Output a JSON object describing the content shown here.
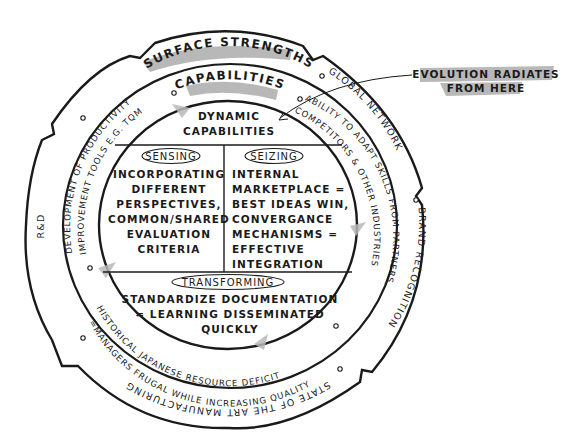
{
  "diagram": {
    "colors": {
      "ink": "#1a1a1a",
      "highlight": "#b8b8b8",
      "background": "#ffffff"
    },
    "outer_ring": {
      "heading": "SURFACE STRENGTHS",
      "items": [
        "GLOBAL NETWORK",
        "BRAND RECOGNITION",
        "STATE OF THE ART MANUFACTURING",
        "R&D"
      ]
    },
    "middle_ring": {
      "heading": "CAPABILITIES",
      "items": [
        {
          "line1": "ABILITY TO ADAPT SKILLS FROM PARTNERS,",
          "line2": "COMPETITORS & OTHER INDUSTRIES"
        },
        {
          "line1": "HISTORICAL JAPANESE RESOURCE DEFICIT",
          "line2": "=MANAGERS FRUGAL WHILE INCREASING QUALITY"
        },
        {
          "line1": "DEVELOPMENT OF PRODUCTIVITY",
          "line2": "IMPROVEMENT TOOLS E.G. TQM"
        }
      ]
    },
    "core": {
      "title_line1": "DYNAMIC",
      "title_line2": "CAPABILITIES",
      "sensing": {
        "label": "SENSING",
        "lines": [
          "INCORPORATING",
          "DIFFERENT",
          "PERSPECTIVES,",
          "COMMON/SHARED",
          "EVALUATION",
          "CRITERIA"
        ]
      },
      "seizing": {
        "label": "SEIZING",
        "lines": [
          "INTERNAL",
          "MARKETPLACE =",
          "BEST IDEAS WIN,",
          "CONVERGANCE",
          "MECHANISMS =",
          "EFFECTIVE",
          "INTEGRATION"
        ]
      },
      "transforming": {
        "label": "TRANSFORMING",
        "lines": [
          "STANDARDIZE DOCUMENTATION",
          "= LEARNING DISSEMINATED",
          "QUICKLY"
        ]
      }
    },
    "callout": {
      "line1": "EVOLUTION RADIATES",
      "line2": "FROM HERE"
    }
  }
}
